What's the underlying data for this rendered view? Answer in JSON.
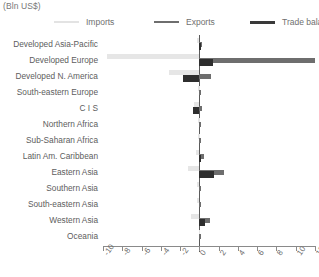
{
  "header": {
    "unit_label": "(Bln US$)"
  },
  "legend": {
    "items": [
      {
        "label": "Imports",
        "color": "#e3e3e3"
      },
      {
        "label": "Exports",
        "color": "#6e6e6e"
      },
      {
        "label": "Trade balance",
        "color": "#3a3a3a"
      }
    ]
  },
  "colors": {
    "imports": "#e6e6e6",
    "exports": "#6e6e6e",
    "balance": "#2e2e2e",
    "axis": "#8a8a8a",
    "text": "#5d5d5d"
  },
  "chart_data": {
    "type": "bar",
    "orientation": "horizontal",
    "title": "",
    "subtitle": "",
    "xlabel": "(Bln US$)",
    "ylabel": "",
    "xlim": [
      -10,
      12
    ],
    "xticks": [
      -10,
      -8,
      -6,
      -4,
      -2,
      0,
      2,
      4,
      6,
      8,
      10,
      12
    ],
    "xticklabels": [
      "-10",
      "-8",
      "-6",
      "-4",
      "-2",
      "0",
      "2",
      "4",
      "6",
      "8",
      "10",
      "12"
    ],
    "grid": false,
    "legend_position": "top",
    "categories": [
      "Developed Asia-Pacific",
      "Developed Europe",
      "Developed N. America",
      "South-eastern Europe",
      "C I S",
      "Northern Africa",
      "Sub-Saharan Africa",
      "Latin Am. Caribbean",
      "Eastern Asia",
      "Southern Asia",
      "South-eastern Asia",
      "Western Asia",
      "Oceania"
    ],
    "series": [
      {
        "name": "Imports",
        "color": "#e6e6e6",
        "values": [
          -0.2,
          -9.6,
          -3.2,
          -0.1,
          -0.6,
          -0.1,
          -0.1,
          -0.3,
          -1.2,
          -0.2,
          -0.2,
          -0.9,
          -0.05
        ]
      },
      {
        "name": "Exports",
        "color": "#6e6e6e",
        "values": [
          0.3,
          12.0,
          1.2,
          0.1,
          0.3,
          0.1,
          0.1,
          0.5,
          2.6,
          0.2,
          0.2,
          1.1,
          0.05
        ]
      },
      {
        "name": "Trade balance",
        "color": "#2e2e2e",
        "values": [
          0.1,
          1.4,
          -1.7,
          0.0,
          -0.7,
          0.0,
          0.0,
          0.2,
          1.5,
          0.0,
          0.0,
          0.6,
          0.0
        ]
      }
    ]
  }
}
